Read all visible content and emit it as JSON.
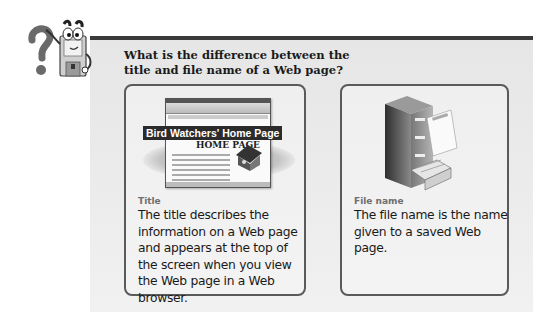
{
  "header": {
    "question": "What is the difference between the title and file name of a Web page?"
  },
  "mascot": {
    "icon": "floppy-disk-mascot-with-question-mark-icon"
  },
  "cards": [
    {
      "heading": "Title",
      "body": "The title describes the information on a Web page and appears at the top of the screen when you view the Web page in a Web browser.",
      "illustration": {
        "icon": "web-browser-window-icon",
        "banner_text": "Bird Watchers' Home Page",
        "page_heading": "HOME PAGE"
      }
    },
    {
      "heading": "File name",
      "body": "The file name is the name given to a saved Web page.",
      "illustration": {
        "icon": "file-cabinet-icon"
      }
    }
  ],
  "colors": {
    "panel_bg": "#ececec",
    "top_bar": "#3a3a3a",
    "card_border": "#5a5a5a",
    "heading_gray": "#6e6e6e",
    "text": "#1a1a1a"
  }
}
